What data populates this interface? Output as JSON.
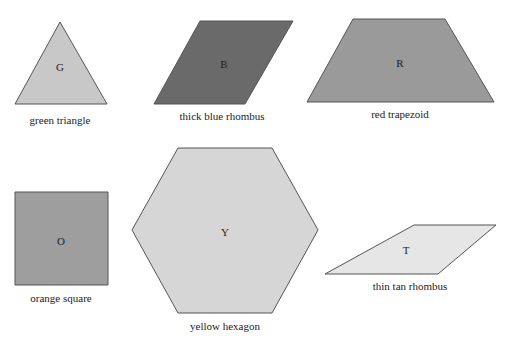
{
  "shapes": [
    {
      "id": "green-triangle",
      "letter": "G",
      "caption": "green triangle",
      "fill": "#c8c8c8",
      "points": "60,22 107,104 15,104",
      "letter_pos": [
        60,
        71
      ],
      "caption_pos": [
        60,
        124
      ]
    },
    {
      "id": "thick-blue-rhombus",
      "letter": "B",
      "caption": "thick blue rhombus",
      "fill": "#6a6a6a",
      "points": "200,21 293,21 245,104 154,104",
      "letter_pos": [
        224,
        68
      ],
      "caption_pos": [
        222,
        120
      ]
    },
    {
      "id": "red-trapezoid",
      "letter": "R",
      "caption": "red trapezoid",
      "fill": "#9a9a9a",
      "points": "353,19 445,19 494,102 307,102",
      "letter_pos": [
        400,
        67
      ],
      "caption_pos": [
        400,
        118
      ]
    },
    {
      "id": "orange-square",
      "letter": "O",
      "caption": "orange square",
      "fill": "#9e9e9e",
      "points": "15,192 108,192 108,285 15,285",
      "letter_pos": [
        61,
        245
      ],
      "caption_pos": [
        61,
        302
      ]
    },
    {
      "id": "yellow-hexagon",
      "letter": "Y",
      "caption": "yellow hexagon",
      "fill": "#d6d6d6",
      "points": "178,148 272,148 318,230 272,313 178,313 132,230",
      "letter_pos": [
        225,
        236
      ],
      "caption_pos": [
        225,
        330
      ]
    },
    {
      "id": "thin-tan-rhombus",
      "letter": "T",
      "caption": "thin tan rhombus",
      "fill": "#e6e6e6",
      "points": "414,225 496,225 438,274 325,274",
      "letter_pos": [
        406,
        254
      ],
      "caption_pos": [
        410,
        290
      ]
    }
  ],
  "stroke": "#555555"
}
